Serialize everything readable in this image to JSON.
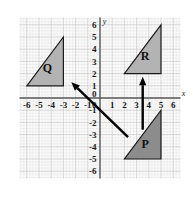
{
  "figure": {
    "title": "",
    "background_color": "#ffffff",
    "width": 193,
    "height": 197
  },
  "chart_data": {
    "type": "scatter",
    "title": "",
    "xlabel": "x",
    "ylabel": "y",
    "xlim": [
      -6.6,
      6.6
    ],
    "ylim": [
      -6.6,
      6.6
    ],
    "grid": true,
    "grid_major_step": 1,
    "grid_minor_step": 0.25,
    "legend": "none",
    "x_ticks": [
      -6,
      -5,
      -4,
      -3,
      -2,
      -1,
      0,
      1,
      2,
      3,
      4,
      5,
      6
    ],
    "y_ticks": [
      6,
      5,
      4,
      3,
      2,
      1,
      0,
      -1,
      -2,
      -3,
      -4,
      -5,
      -6
    ],
    "x_tick_labels": [
      "-6",
      "-5",
      "-4",
      "-3",
      "-2",
      "-1",
      "0",
      "1",
      "2",
      "3",
      "4",
      "5",
      "6"
    ],
    "y_tick_labels": [
      "6",
      "5",
      "4",
      "3",
      "2",
      "1",
      "0",
      "-1",
      "-2",
      "-3",
      "-4",
      "-5",
      "-6"
    ],
    "shapes": [
      {
        "name": "Q",
        "label": "Q",
        "type": "triangle",
        "vertices": [
          [
            -6,
            1
          ],
          [
            -3,
            1
          ],
          [
            -3,
            5
          ]
        ],
        "label_position": [
          -4.3,
          2.1
        ],
        "fill": "#b3b3b3",
        "stroke": "#1a1a1a"
      },
      {
        "name": "R",
        "label": "R",
        "type": "triangle",
        "vertices": [
          [
            2,
            2
          ],
          [
            5,
            2
          ],
          [
            5,
            6
          ]
        ],
        "label_position": [
          3.7,
          3.1
        ],
        "fill": "#b3b3b3",
        "stroke": "#1a1a1a"
      },
      {
        "name": "P",
        "label": "P",
        "type": "triangle",
        "vertices": [
          [
            2,
            -5
          ],
          [
            5,
            -5
          ],
          [
            5,
            -1
          ]
        ],
        "label_position": [
          3.7,
          -4.1
        ],
        "fill": "#8c8c8c",
        "stroke": "#1a1a1a"
      }
    ],
    "arrows": [
      {
        "name": "arrow-p-to-r",
        "from": [
          3.5,
          -2.6
        ],
        "to": [
          3.5,
          1.75
        ],
        "color": "#000000",
        "description": "vertical translation arrow from P up to R"
      },
      {
        "name": "arrow-p-to-q",
        "from": [
          2.3,
          -3.2
        ],
        "to": [
          -2.35,
          1.3
        ],
        "color": "#000000",
        "description": "diagonal translation arrow from P up-left to Q"
      }
    ],
    "colors": {
      "axis": "#5a5a5a",
      "grid_major": "#c9c9c9",
      "grid_minor": "#e4e4e4",
      "text": "#1a1a1a",
      "shape_light": "#b3b3b3",
      "shape_dark": "#8c8c8c",
      "arrow": "#000000"
    }
  }
}
